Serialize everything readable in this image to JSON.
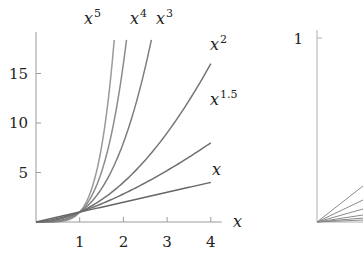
{
  "chart_data": [
    {
      "type": "line",
      "panel": "left",
      "title": "",
      "xlabel": "x",
      "ylabel": "",
      "xlim": [
        0,
        4.25
      ],
      "ylim": [
        0,
        18.4
      ],
      "xticks": [
        1,
        2,
        3,
        4
      ],
      "xtick_labels": [
        "1",
        "2",
        "3",
        "4"
      ],
      "yticks": [
        5,
        10,
        15
      ],
      "ytick_labels": [
        "5",
        "10",
        "15"
      ],
      "grid": false,
      "legend": "inline labels at curve ends",
      "series": [
        {
          "name": "x^5",
          "label_base": "x",
          "label_exp": "5",
          "exponent": 5,
          "color": "#9a9a9a"
        },
        {
          "name": "x^4",
          "label_base": "x",
          "label_exp": "4",
          "exponent": 4,
          "color": "#8c8c8c"
        },
        {
          "name": "x^3",
          "label_base": "x",
          "label_exp": "3",
          "exponent": 3,
          "color": "#7e7e7e"
        },
        {
          "name": "x^2",
          "label_base": "x",
          "label_exp": "2",
          "exponent": 2,
          "color": "#747474"
        },
        {
          "name": "x^1.5",
          "label_base": "x",
          "label_exp": "1.5",
          "exponent": 1.5,
          "color": "#6e6e6e"
        },
        {
          "name": "x",
          "label_base": "x",
          "label_exp": "",
          "exponent": 1,
          "color": "#666666"
        }
      ],
      "sample_points": {
        "x": [
          0,
          0.5,
          1,
          1.5,
          2,
          2.5,
          3,
          3.5,
          4
        ],
        "x^1": [
          0,
          0.5,
          1,
          1.5,
          2,
          2.5,
          3,
          3.5,
          4
        ],
        "x^1.5": [
          0,
          0.35,
          1,
          1.84,
          2.83,
          3.95,
          5.2,
          6.55,
          8
        ],
        "x^2": [
          0,
          0.25,
          1,
          2.25,
          4,
          6.25,
          9,
          12.25,
          16
        ],
        "x^3": [
          0,
          0.125,
          1,
          3.375,
          8,
          15.6
        ],
        "x^4": [
          0,
          0.0625,
          1,
          5.06,
          16
        ],
        "x^5": [
          0,
          0.031,
          1,
          7.59
        ]
      }
    },
    {
      "type": "line",
      "panel": "right",
      "title": "",
      "xlabel": "",
      "ylabel": "",
      "ylim": [
        0,
        1
      ],
      "yticks": [
        1
      ],
      "ytick_labels": [
        "1"
      ],
      "grid": false,
      "note": "partially visible panel, cropped at right edge; fan of lines from origin",
      "series": [
        {
          "name": "line-1",
          "end_y_px": 186
        },
        {
          "name": "line-2",
          "end_y_px": 200
        },
        {
          "name": "line-3",
          "end_y_px": 209
        },
        {
          "name": "line-4",
          "end_y_px": 215
        },
        {
          "name": "line-5",
          "end_y_px": 218
        },
        {
          "name": "line-6",
          "end_y_px": 220
        }
      ]
    }
  ]
}
